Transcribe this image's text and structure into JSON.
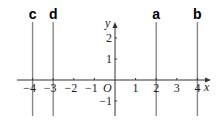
{
  "diagram": {
    "type": "coordinate-plane-vertical-lines",
    "axes": {
      "x_label": "x",
      "y_label": "y",
      "origin_label": "O",
      "x_ticks": [
        {
          "value": -4,
          "label": "−4"
        },
        {
          "value": -3,
          "label": "−3"
        },
        {
          "value": -2,
          "label": "−2"
        },
        {
          "value": -1,
          "label": "−1"
        },
        {
          "value": 1,
          "label": "1"
        },
        {
          "value": 2,
          "label": "2"
        },
        {
          "value": 3,
          "label": "3"
        },
        {
          "value": 4,
          "label": "4"
        }
      ],
      "y_ticks": [
        {
          "value": 2,
          "label": "2"
        },
        {
          "value": 1,
          "label": "1"
        },
        {
          "value": -1,
          "label": "−1"
        }
      ]
    },
    "lines": [
      {
        "label": "c",
        "x": -4
      },
      {
        "label": "d",
        "x": -3
      },
      {
        "label": "a",
        "x": 2
      },
      {
        "label": "b",
        "x": 4
      }
    ],
    "colors": {
      "axis": "#333333",
      "line": "#888888",
      "text": "#000000"
    }
  }
}
